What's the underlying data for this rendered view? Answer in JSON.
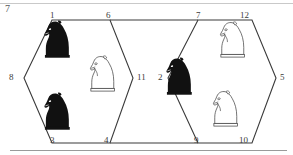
{
  "figure": {
    "title": "",
    "stray_label": "7",
    "line_color": "#3a3a3a",
    "black_piece_color": "#111111",
    "white_piece_color": "#ffffff",
    "white_piece_outline": "#3a3a3a",
    "rule_color": "#9a9a9a"
  },
  "vertices": [
    {
      "id": "v1",
      "label": "1",
      "x": 50,
      "y": 11
    },
    {
      "id": "v6",
      "label": "6",
      "x": 106,
      "y": 11
    },
    {
      "id": "v7",
      "label": "7",
      "x": 196,
      "y": 11
    },
    {
      "id": "v12",
      "label": "12",
      "x": 240,
      "y": 11
    },
    {
      "id": "v8",
      "label": "8",
      "x": 9,
      "y": 73
    },
    {
      "id": "v11",
      "label": "11",
      "x": 137,
      "y": 73
    },
    {
      "id": "v2",
      "label": "2",
      "x": 161,
      "y": 73
    },
    {
      "id": "v5",
      "label": "5",
      "x": 281,
      "y": 73
    },
    {
      "id": "v3",
      "label": "3",
      "x": 50,
      "y": 136
    },
    {
      "id": "v4",
      "label": "4",
      "x": 104,
      "y": 136
    },
    {
      "id": "v9",
      "label": "9",
      "x": 194,
      "y": 136
    },
    {
      "id": "v10",
      "label": "10",
      "x": 240,
      "y": 136
    }
  ],
  "hexagons": [
    {
      "id": "left-hexagon",
      "name": "left-hexagon",
      "vertex_labels": [
        "1",
        "6",
        "11",
        "4",
        "3",
        "8"
      ],
      "points": "52,20 110,20 133,78 110,143 52,143 24,78"
    },
    {
      "id": "right-hexagon",
      "name": "right-hexagon",
      "vertex_labels": [
        "7",
        "12",
        "5",
        "10",
        "9",
        "2"
      ],
      "points": "198,20 252,20 276,78 252,143 198,143 168,78"
    }
  ],
  "pieces": [
    {
      "id": "p1",
      "type": "knight",
      "color": "black",
      "hexagon": "left-hexagon",
      "near_vertex": "1",
      "x": 44,
      "y": 20,
      "scale": 0.46
    },
    {
      "id": "p2",
      "type": "knight",
      "color": "white",
      "hexagon": "left-hexagon",
      "near_vertex": "11",
      "x": 90,
      "y": 55,
      "scale": 0.44
    },
    {
      "id": "p3",
      "type": "knight",
      "color": "black",
      "hexagon": "left-hexagon",
      "near_vertex": "3",
      "x": 44,
      "y": 92,
      "scale": 0.46
    },
    {
      "id": "p4",
      "type": "knight",
      "color": "black",
      "hexagon": "right-hexagon",
      "near_vertex": "2",
      "x": 166,
      "y": 57,
      "scale": 0.46
    },
    {
      "id": "p5",
      "type": "knight",
      "color": "white",
      "hexagon": "right-hexagon",
      "near_vertex": "12",
      "x": 220,
      "y": 21,
      "scale": 0.44
    },
    {
      "id": "p6",
      "type": "knight",
      "color": "white",
      "hexagon": "right-hexagon",
      "near_vertex": "10",
      "x": 213,
      "y": 90,
      "scale": 0.44
    }
  ],
  "icons": {
    "knight_black": "knight-black-icon",
    "knight_white": "knight-white-icon"
  }
}
